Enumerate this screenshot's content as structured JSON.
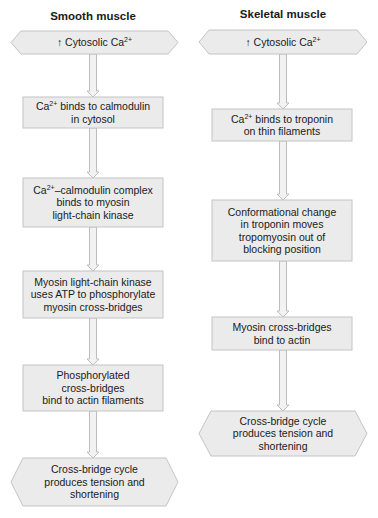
{
  "colors": {
    "node_fill": "#ebebeb",
    "node_stroke": "#c4c4c4",
    "arrow_fill": "#f2f2f2",
    "arrow_stroke": "#bdbdbd",
    "text": "#1a1a1a"
  },
  "columns": [
    {
      "title": "Smooth muscle",
      "nodes": [
        {
          "shape": "hexagon",
          "lines": [
            "↑ Cytosolic Ca²⁺"
          ]
        },
        {
          "shape": "box",
          "lines": [
            "Ca²⁺ binds to calmodulin",
            "in cytosol"
          ]
        },
        {
          "shape": "box",
          "lines": [
            "Ca²⁺–calmodulin complex",
            "binds to myosin",
            "light-chain kinase"
          ]
        },
        {
          "shape": "box",
          "lines": [
            "Myosin light-chain kinase",
            "uses ATP to phosphorylate",
            "myosin cross-bridges"
          ]
        },
        {
          "shape": "box",
          "lines": [
            "Phosphorylated",
            "cross-bridges",
            "bind to actin filaments"
          ]
        },
        {
          "shape": "hexagon",
          "lines": [
            "Cross-bridge cycle",
            "produces tension and",
            "shortening"
          ]
        }
      ]
    },
    {
      "title": "Skeletal muscle",
      "nodes": [
        {
          "shape": "hexagon",
          "lines": [
            "↑ Cytosolic Ca²⁺"
          ]
        },
        {
          "shape": "box",
          "lines": [
            "Ca²⁺ binds to troponin",
            "on thin filaments"
          ]
        },
        {
          "shape": "box",
          "lines": [
            "Conformational change",
            "in troponin moves",
            "tropomyosin out of",
            "blocking position"
          ]
        },
        {
          "shape": "box",
          "lines": [
            "Myosin cross-bridges",
            "bind to actin"
          ]
        },
        {
          "shape": "hexagon",
          "lines": [
            "Cross-bridge cycle",
            "produces tension and",
            "shortening"
          ]
        }
      ]
    }
  ]
}
